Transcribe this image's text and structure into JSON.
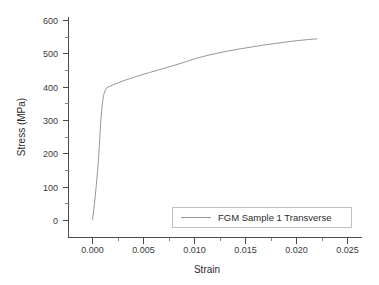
{
  "chart_data": {
    "type": "line",
    "title": "",
    "xlabel": "Strain",
    "ylabel": "Stress (MPa)",
    "xlim": [
      -0.0025,
      0.0265
    ],
    "ylim": [
      -45,
      615
    ],
    "grid": false,
    "legend_position": "bottom-right",
    "x_ticks": [
      0.0,
      0.005,
      0.01,
      0.015,
      0.02,
      0.025
    ],
    "x_tick_labels": [
      "0.000",
      "0.005",
      "0.010",
      "0.015",
      "0.020",
      "0.025"
    ],
    "x_minor_ticks": [
      0.0025,
      0.0075,
      0.0125,
      0.0175,
      0.0225
    ],
    "y_ticks": [
      0,
      100,
      200,
      300,
      400,
      500,
      600
    ],
    "y_tick_labels": [
      "0",
      "100",
      "200",
      "300",
      "400",
      "500",
      "600"
    ],
    "y_minor_ticks": [
      50,
      150,
      250,
      350,
      450,
      550
    ],
    "series": [
      {
        "name": "FGM Sample 1 Transverse",
        "color": "#8a8a8a",
        "x": [
          0.0,
          0.00012,
          0.00025,
          0.00038,
          0.0005,
          0.0006,
          0.00068,
          0.00075,
          0.00082,
          0.0009,
          0.00098,
          0.00108,
          0.0012,
          0.00135,
          0.00152,
          0.00172,
          0.00195,
          0.00225,
          0.0026,
          0.003,
          0.0035,
          0.0041,
          0.0048,
          0.0056,
          0.0065,
          0.0074,
          0.0083,
          0.0092,
          0.0101,
          0.0111,
          0.0121,
          0.0132,
          0.0143,
          0.0155,
          0.0167,
          0.0179,
          0.0191,
          0.0202,
          0.0212,
          0.022
        ],
        "y": [
          3,
          30,
          68,
          108,
          150,
          190,
          230,
          268,
          300,
          330,
          355,
          375,
          388,
          396,
          400,
          403,
          406,
          410,
          414,
          419,
          424,
          430,
          437,
          444,
          452,
          460,
          468,
          477,
          486,
          494,
          501,
          508,
          514,
          520,
          526,
          531,
          536,
          540,
          543,
          545
        ]
      }
    ]
  },
  "legend": {
    "entries": [
      {
        "label": "FGM Sample 1 Transverse"
      }
    ]
  }
}
